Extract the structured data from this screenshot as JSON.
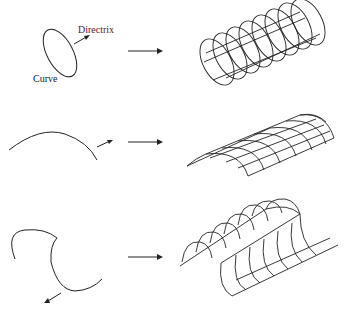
{
  "diagram": {
    "type": "surface-of-extrusion illustration",
    "rows": [
      {
        "id": "row-1",
        "input": "closed elliptical curve with directrix arrow",
        "labels": {
          "directrix": "Directrix",
          "curve": "Curve"
        },
        "output": "cylindrical tube wireframe (extruded ellipse)"
      },
      {
        "id": "row-2",
        "input": "open arc curve with directrix arrow",
        "output": "curved sheet wireframe (extruded arc)"
      },
      {
        "id": "row-3",
        "input": "S-shaped open curve with directrix arrow",
        "output": "S-shaped wall wireframe (extruded S-curve)"
      }
    ],
    "colors": {
      "stroke": "#222222",
      "directrix_label": "#5a2030",
      "background": "#ffffff"
    }
  }
}
